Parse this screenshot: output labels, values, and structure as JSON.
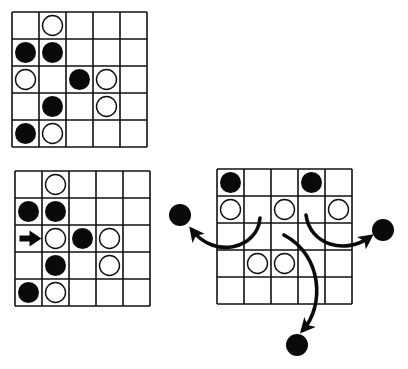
{
  "colors": {
    "line": "#111111",
    "black_stone": "#0a0a0a",
    "white_stone": "#ffffff",
    "background": "#ffffff"
  },
  "legend": {
    "B": "black-stone",
    "W": "white-stone",
    "_": "empty",
    ">": "arrow-marker"
  },
  "boards": [
    {
      "name": "board-top-left",
      "x": 12,
      "y": 12,
      "size": 5,
      "cell": 27,
      "rows": [
        [
          "_",
          "W",
          "_",
          "_",
          "_"
        ],
        [
          "B",
          "B",
          "_",
          "_",
          "_"
        ],
        [
          "W",
          "_",
          "B",
          "W",
          "_"
        ],
        [
          "_",
          "B",
          "_",
          "W",
          "_"
        ],
        [
          "B",
          "W",
          "_",
          "_",
          "_"
        ]
      ]
    },
    {
      "name": "board-bottom-left",
      "x": 15,
      "y": 171,
      "size": 5,
      "cell": 27,
      "rows": [
        [
          "_",
          "W",
          "_",
          "_",
          "_"
        ],
        [
          "B",
          "B",
          "_",
          "_",
          "_"
        ],
        [
          ">",
          "W",
          "B",
          "W",
          "_"
        ],
        [
          "_",
          "B",
          "_",
          "W",
          "_"
        ],
        [
          "B",
          "W",
          "_",
          "_",
          "_"
        ]
      ]
    },
    {
      "name": "board-bottom-right",
      "x": 217,
      "y": 169,
      "size": 5,
      "cell": 27,
      "rows": [
        [
          "B",
          "_",
          "_",
          "B",
          "_"
        ],
        [
          "W",
          "_",
          "W",
          "_",
          "W"
        ],
        [
          "_",
          "_",
          "_",
          "_",
          "_"
        ],
        [
          "_",
          "W",
          "W",
          "_",
          "_"
        ],
        [
          "_",
          "_",
          "_",
          "_",
          "_"
        ]
      ]
    }
  ],
  "captured_stones": [
    {
      "name": "captured-stone-left",
      "cx": 180,
      "cy": 215,
      "r": 11
    },
    {
      "name": "captured-stone-right",
      "cx": 383,
      "cy": 230,
      "r": 11
    },
    {
      "name": "captured-stone-bottom",
      "cx": 297,
      "cy": 345,
      "r": 11
    }
  ],
  "curved_arrows": [
    {
      "name": "arrow-to-left",
      "path": "M 260 218 C 258 248, 215 260, 192 230",
      "head": [
        190,
        227
      ],
      "angle": 230
    },
    {
      "name": "arrow-to-right",
      "path": "M 306 215 C 310 245, 345 255, 370 237",
      "head": [
        372,
        236
      ],
      "angle": -20
    },
    {
      "name": "arrow-to-bottom",
      "path": "M 284 235 C 322 255, 325 305, 303 330",
      "head": [
        302,
        333
      ],
      "angle": 110
    }
  ]
}
